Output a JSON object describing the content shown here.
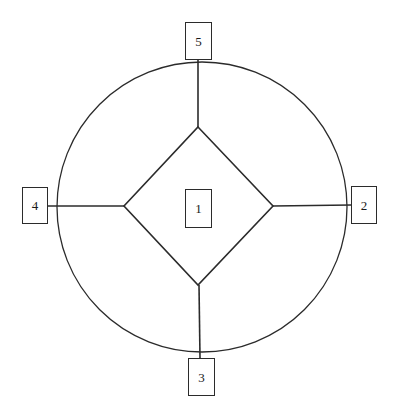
{
  "figure": {
    "title": "",
    "background_color": "#ffffff",
    "stroke_color": "#2b2b2b",
    "text_color": "#1a1a1a"
  },
  "nodes": [
    {
      "id": "1",
      "label": "1",
      "position": "center",
      "x": 198,
      "y": 208
    },
    {
      "id": "2",
      "label": "2",
      "position": "right",
      "x": 364,
      "y": 205
    },
    {
      "id": "3",
      "label": "3",
      "position": "bottom",
      "x": 201,
      "y": 377
    },
    {
      "id": "4",
      "label": "4",
      "position": "left",
      "x": 35,
      "y": 205
    },
    {
      "id": "5",
      "label": "5",
      "position": "top",
      "x": 198,
      "y": 41
    }
  ],
  "shapes": {
    "circle": {
      "name": "outer-circle",
      "center_x": 202,
      "center_y": 207,
      "radius": 145
    },
    "diamond": {
      "name": "inner-diamond",
      "vertices": [
        {
          "name": "top",
          "x": 198,
          "y": 127
        },
        {
          "name": "right",
          "x": 273,
          "y": 206
        },
        {
          "name": "bottom",
          "x": 198,
          "y": 285
        },
        {
          "name": "left",
          "x": 124,
          "y": 206
        }
      ]
    }
  },
  "connectors": [
    {
      "name": "spoke-top",
      "from": "diamond-top",
      "to": "node-5",
      "x1": 198,
      "y1": 127,
      "x2": 198,
      "y2": 60
    },
    {
      "name": "spoke-right",
      "from": "diamond-right",
      "to": "node-2",
      "x1": 273,
      "y1": 206,
      "x2": 351,
      "y2": 205
    },
    {
      "name": "spoke-bottom",
      "from": "diamond-bottom",
      "to": "node-3",
      "x1": 199,
      "y1": 285,
      "x2": 200,
      "y2": 358
    },
    {
      "name": "spoke-left",
      "from": "diamond-left",
      "to": "node-4",
      "x1": 124,
      "y1": 206,
      "x2": 48,
      "y2": 206
    }
  ]
}
